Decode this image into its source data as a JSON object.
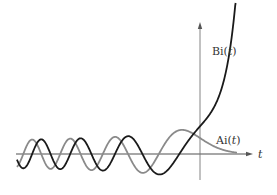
{
  "chart_data": {
    "type": "line",
    "title": "",
    "xlabel": "t",
    "ylabel": "",
    "xlim": [
      -10.4,
      3.1
    ],
    "ylim": [
      -0.6,
      3.3
    ],
    "grid": false,
    "legend": "inline labels",
    "series": [
      {
        "name": "Ai(t)",
        "label_prefix": "Ai(",
        "label_var": "t",
        "label_suffix": ")",
        "color": "#8a8a8a",
        "t_range": [
          -10.4,
          2.1
        ],
        "sample_points": [
          {
            "t": -10,
            "y": 0.04
          },
          {
            "t": -8,
            "y": -0.05
          },
          {
            "t": -6,
            "y": -0.33
          },
          {
            "t": -4,
            "y": -0.07
          },
          {
            "t": -2.34,
            "y": 0.0
          },
          {
            "t": -1.02,
            "y": 0.54
          },
          {
            "t": 0,
            "y": 0.355
          },
          {
            "t": 1,
            "y": 0.135
          },
          {
            "t": 2,
            "y": 0.035
          }
        ]
      },
      {
        "name": "Bi(t)",
        "label_prefix": "Bi(",
        "label_var": "t",
        "label_suffix": ")",
        "color": "#1a1a1a",
        "t_range": [
          -10.4,
          2.05
        ],
        "sample_points": [
          {
            "t": -10,
            "y": -0.31
          },
          {
            "t": -8,
            "y": -0.27
          },
          {
            "t": -6,
            "y": -0.15
          },
          {
            "t": -4,
            "y": 0.39
          },
          {
            "t": -2.29,
            "y": -0.45
          },
          {
            "t": -1.17,
            "y": 0.0
          },
          {
            "t": 0,
            "y": 0.614
          },
          {
            "t": 1,
            "y": 1.21
          },
          {
            "t": 2,
            "y": 3.3
          }
        ]
      }
    ]
  },
  "axes": {
    "t_label": "t",
    "origin_px": [
      200,
      154
    ],
    "x_px_per_unit": 17.6,
    "y_px_per_unit": 45,
    "x_axis_px": [
      16,
      253
    ],
    "y_axis_px": [
      22,
      180
    ]
  },
  "labels": {
    "bi": {
      "x": 212,
      "y": 55
    },
    "ai": {
      "x": 216,
      "y": 144
    }
  }
}
